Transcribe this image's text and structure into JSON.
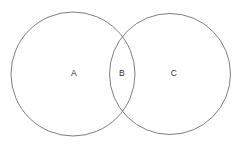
{
  "figure": {
    "type": "venn-diagram",
    "title": "",
    "background_color": "#ffffff",
    "width": 240,
    "height": 149
  },
  "style": {
    "circle_stroke_color": "#6e6e6e",
    "circle_stroke_width": 0.9,
    "circle_fill": "none",
    "label_color": "#2b2b2b",
    "label_font_size": 8.5
  },
  "circles": [
    {
      "id": "circle-left",
      "name": "left-set-circle",
      "cx": 73,
      "cy": 74,
      "r": 62,
      "stroke": "#6e6e6e"
    },
    {
      "id": "circle-right",
      "name": "right-set-circle",
      "cx": 170,
      "cy": 74,
      "r": 60.5,
      "stroke": "#6e6e6e"
    }
  ],
  "labels": [
    {
      "id": "label-a",
      "text": "A",
      "x": 74,
      "y": 73,
      "region": "left-only"
    },
    {
      "id": "label-b",
      "text": "B",
      "x": 122,
      "y": 73,
      "region": "intersection"
    },
    {
      "id": "label-c",
      "text": "C",
      "x": 174,
      "y": 73,
      "region": "right-only"
    }
  ],
  "chart_data": {
    "type": "venn",
    "title": "",
    "sets": [
      "Left circle",
      "Right circle"
    ],
    "regions": [
      {
        "label": "A",
        "description": "left circle only"
      },
      {
        "label": "B",
        "description": "intersection of both circles"
      },
      {
        "label": "C",
        "description": "right circle only"
      }
    ],
    "legend": "none",
    "grid": false
  }
}
